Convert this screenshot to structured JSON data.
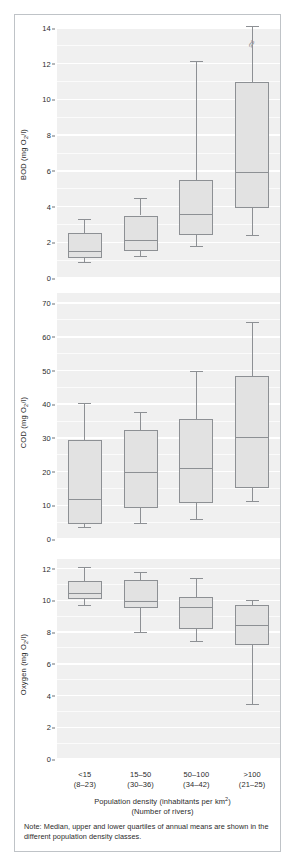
{
  "figure": {
    "note": "Note: Median, upper and lower quartiles of annual means are shown in the different population density classes.",
    "xaxis_title_line1": "Population density (inhabitants per km2)",
    "xaxis_title_line2": "(Number of rivers)",
    "colors": {
      "plot_background": "#f0f0f0",
      "gridline": "#ffffff",
      "box_fill": "#e2e2e2",
      "box_stroke": "#8d9094",
      "text": "#2b2b2b",
      "frame": "#bfc3c7"
    }
  },
  "categories": [
    {
      "class": "<15",
      "rivers": "(8-23)"
    },
    {
      "class": "15-50",
      "rivers": "(30-36)"
    },
    {
      "class": "50-100",
      "rivers": "(34-42)"
    },
    {
      "class": ">100",
      "rivers": "(21-25)"
    }
  ],
  "chart_data": [
    {
      "type": "box",
      "title": "BOD",
      "ylabel": "BOD (mg O2/l)",
      "xlabel": "Population density (inhabitants per km2)",
      "ylim": [
        0,
        14
      ],
      "yticks": [
        0,
        2,
        4,
        6,
        8,
        10,
        12,
        14
      ],
      "ytick_labels": [
        "0",
        "2",
        "4",
        "6",
        "8",
        "10",
        "12",
        "14"
      ],
      "grid": true,
      "categories": [
        "<15",
        "15-50",
        "50-100",
        ">100"
      ],
      "boxes": [
        {
          "category": "<15",
          "min": 0.9,
          "q1": 1.1,
          "median": 1.5,
          "q3": 2.5,
          "max": 3.3,
          "axis_break": false
        },
        {
          "category": "15-50",
          "min": 1.25,
          "q1": 1.5,
          "median": 2.15,
          "q3": 3.5,
          "max": 4.5,
          "axis_break": false
        },
        {
          "category": "50-100",
          "min": 1.8,
          "q1": 2.4,
          "median": 3.6,
          "q3": 5.5,
          "max": 12.15,
          "axis_break": false
        },
        {
          "category": ">100",
          "min": 2.4,
          "q1": 3.9,
          "median": 5.95,
          "q3": 11.0,
          "max": 14.1,
          "axis_break": true
        }
      ]
    },
    {
      "type": "box",
      "title": "COD",
      "ylabel": "COD (mg O2/l)",
      "xlabel": "Population density (inhabitants per km2)",
      "ylim": [
        0,
        73
      ],
      "yticks": [
        0,
        10,
        20,
        30,
        40,
        50,
        60,
        70
      ],
      "ytick_labels": [
        "0",
        "10",
        "20",
        "30",
        "40",
        "50",
        "60",
        "70"
      ],
      "grid": true,
      "categories": [
        "<15",
        "15-50",
        "50-100",
        ">100"
      ],
      "boxes": [
        {
          "category": "<15",
          "min": 3.5,
          "q1": 4.5,
          "median": 12.0,
          "q3": 29.5,
          "max": 40.5,
          "axis_break": false
        },
        {
          "category": "15-50",
          "min": 4.8,
          "q1": 9.2,
          "median": 19.8,
          "q3": 32.2,
          "max": 37.8,
          "axis_break": false
        },
        {
          "category": "50-100",
          "min": 5.8,
          "q1": 10.8,
          "median": 21.0,
          "q3": 35.5,
          "max": 49.8,
          "axis_break": false
        },
        {
          "category": ">100",
          "min": 11.2,
          "q1": 15.2,
          "median": 30.3,
          "q3": 48.5,
          "max": 64.3,
          "axis_break": false
        }
      ]
    },
    {
      "type": "box",
      "title": "Oxygen",
      "ylabel": "Oxygen (mg O2/l)",
      "xlabel": "Population density (inhabitants per km2)",
      "ylim": [
        0,
        12.6
      ],
      "yticks": [
        0,
        2,
        4,
        6,
        8,
        10,
        12
      ],
      "ytick_labels": [
        "0",
        "2",
        "4",
        "6",
        "8",
        "10",
        "12"
      ],
      "grid": true,
      "categories": [
        "<15",
        "15-50",
        "50-100",
        ">100"
      ],
      "boxes": [
        {
          "category": "<15",
          "min": 9.7,
          "q1": 10.1,
          "median": 10.45,
          "q3": 11.2,
          "max": 12.1,
          "axis_break": false
        },
        {
          "category": "15-50",
          "min": 8.0,
          "q1": 9.5,
          "median": 9.95,
          "q3": 11.3,
          "max": 11.8,
          "axis_break": false
        },
        {
          "category": "50-100",
          "min": 7.45,
          "q1": 8.2,
          "median": 9.55,
          "q3": 10.2,
          "max": 11.4,
          "axis_break": false
        },
        {
          "category": ">100",
          "min": 3.45,
          "q1": 7.2,
          "median": 8.45,
          "q3": 9.7,
          "max": 10.0,
          "axis_break": false
        }
      ]
    }
  ],
  "yaxis_labels": {
    "bod": {
      "text": "BOD (mg O",
      "sub": "2",
      "tail": "/l)"
    },
    "cod": {
      "text": "COD (mg O",
      "sub": "2",
      "tail": "/l)"
    },
    "oxygen": {
      "text": "Oxygen (mg O",
      "sub": "2",
      "tail": "/l)"
    }
  }
}
